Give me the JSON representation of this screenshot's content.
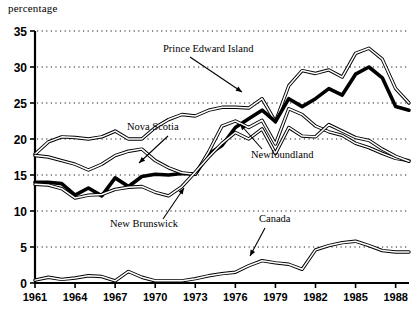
{
  "chart_data": {
    "type": "line",
    "title": "",
    "ylabel": "percentage",
    "xlabel": "",
    "ylim": [
      0,
      35
    ],
    "xlim": [
      1961,
      1989
    ],
    "yticks": [
      0,
      5,
      10,
      15,
      20,
      25,
      30,
      35
    ],
    "xticks": [
      1961,
      1964,
      1967,
      1970,
      1973,
      1976,
      1979,
      1982,
      1985,
      1988
    ],
    "grid": "horizontal-dotted",
    "legend": "none-inline-annotations",
    "x": [
      1961,
      1962,
      1963,
      1964,
      1965,
      1966,
      1967,
      1968,
      1969,
      1970,
      1971,
      1972,
      1973,
      1974,
      1975,
      1976,
      1977,
      1978,
      1979,
      1980,
      1981,
      1982,
      1983,
      1984,
      1985,
      1986,
      1987,
      1988,
      1989
    ],
    "series": [
      {
        "name": "Prince Edward Island",
        "style": "outlined-white-fill",
        "values": [
          17.9,
          19.6,
          20.3,
          20.2,
          20.0,
          20.3,
          21.1,
          20.0,
          20.0,
          21.6,
          22.7,
          23.4,
          23.2,
          24.0,
          24.4,
          24.4,
          24.3,
          25.6,
          22.4,
          27.4,
          29.5,
          29.1,
          29.6,
          28.6,
          31.9,
          32.6,
          31.1,
          27.0,
          25.0
        ]
      },
      {
        "name": "Nova Scotia",
        "style": "thick-black",
        "values": [
          14.0,
          14.0,
          13.8,
          12.2,
          13.2,
          12.1,
          14.6,
          13.4,
          14.8,
          15.1,
          15.0,
          15.2,
          15.1,
          17.9,
          19.1,
          21.6,
          22.8,
          24.0,
          22.4,
          25.6,
          24.5,
          25.6,
          27.0,
          26.1,
          29.0,
          30.0,
          28.5,
          24.5,
          24.0
        ]
      },
      {
        "name": "Newfoundland",
        "style": "outlined-white-fill",
        "values": [
          17.7,
          17.5,
          17.0,
          16.5,
          15.7,
          16.5,
          17.7,
          18.3,
          18.6,
          17.0,
          16.0,
          15.3,
          15.1,
          18.2,
          21.8,
          22.5,
          21.6,
          22.6,
          19.3,
          24.2,
          23.4,
          21.8,
          21.0,
          20.5,
          19.4,
          18.8,
          18.0,
          17.3,
          17.0
        ]
      },
      {
        "name": "New Brunswick",
        "style": "outlined-white-fill",
        "values": [
          13.7,
          13.6,
          13.1,
          11.8,
          12.2,
          12.3,
          13.0,
          13.3,
          13.4,
          12.6,
          12.1,
          13.4,
          15.4,
          17.5,
          19.4,
          20.9,
          20.0,
          21.4,
          18.0,
          21.6,
          20.4,
          20.3,
          22.0,
          21.1,
          20.2,
          19.8,
          18.6,
          17.6,
          16.9
        ]
      },
      {
        "name": "Canada",
        "style": "outlined-white-fill",
        "values": [
          0.4,
          0.8,
          0.5,
          0.7,
          1.0,
          0.9,
          0.3,
          1.6,
          0.8,
          0.3,
          0.3,
          0.3,
          0.6,
          1.0,
          1.3,
          1.5,
          2.4,
          3.1,
          2.8,
          2.6,
          1.9,
          4.6,
          5.2,
          5.6,
          5.8,
          5.2,
          4.5,
          4.3,
          4.3
        ]
      }
    ],
    "annotations": [
      {
        "name": "Prince Edward Island",
        "label": "Prince Edward Island",
        "x": 163,
        "y": 52,
        "arrow": {
          "x1": 190,
          "y1": 57,
          "x2": 242,
          "y2": 92
        }
      },
      {
        "name": "Nova Scotia",
        "label": "Nova Scotia",
        "x": 127,
        "y": 130,
        "arrow": {
          "x1": 168,
          "y1": 136,
          "x2": 139,
          "y2": 163
        }
      },
      {
        "name": "Newfoundland",
        "label": "Newfoundland",
        "x": 251,
        "y": 158,
        "arrow": {
          "x1": 262,
          "y1": 149,
          "x2": 240,
          "y2": 124
        }
      },
      {
        "name": "New Brunswick",
        "label": "New Brunswick",
        "x": 110,
        "y": 227,
        "arrow": {
          "x1": 163,
          "y1": 219,
          "x2": 184,
          "y2": 188
        }
      },
      {
        "name": "Canada",
        "label": "Canada",
        "x": 259,
        "y": 222,
        "arrow": {
          "x1": 265,
          "y1": 228,
          "x2": 250,
          "y2": 256
        }
      }
    ]
  }
}
